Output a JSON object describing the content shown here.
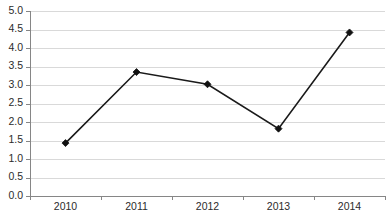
{
  "chart_data": {
    "type": "line",
    "title": "",
    "subtitle": "",
    "xlabel": "",
    "ylabel": "",
    "categories": [
      "2010",
      "2011",
      "2012",
      "2013",
      "2014"
    ],
    "values": [
      1.43,
      3.35,
      3.02,
      1.82,
      4.42
    ],
    "series": [
      {
        "name": "Series 1",
        "values": [
          1.43,
          3.35,
          3.02,
          1.82,
          4.42
        ]
      }
    ],
    "ylim": [
      0.0,
      5.0
    ],
    "ytick_step": 0.5,
    "ytick_labels": [
      "0.0",
      "0.5",
      "1.0",
      "1.5",
      "2.0",
      "2.5",
      "3.0",
      "3.5",
      "4.0",
      "4.5",
      "5.0"
    ],
    "ytick_values": [
      0.0,
      0.5,
      1.0,
      1.5,
      2.0,
      2.5,
      3.0,
      3.5,
      4.0,
      4.5,
      5.0
    ],
    "xtick_labels": [
      "2010",
      "2011",
      "2012",
      "2013",
      "2014"
    ],
    "grid": {
      "horizontal": true,
      "vertical": false,
      "color": "#d9d9d9"
    },
    "legend": {
      "visible": false,
      "position": "none",
      "entries": []
    },
    "marker": {
      "shape": "diamond",
      "color": "#111111",
      "size": 7
    },
    "line": {
      "color": "#1a1a1a",
      "width": 1.6
    },
    "axis": {
      "color": "#868686",
      "x_tick_placement": "between-categories"
    },
    "plot_background": "#ffffff",
    "annotations": []
  },
  "geometry": {
    "width": 389,
    "height": 220,
    "plot_left": 30,
    "plot_right": 385,
    "plot_top": 11,
    "plot_bottom": 196,
    "xlabel_y": 202
  }
}
